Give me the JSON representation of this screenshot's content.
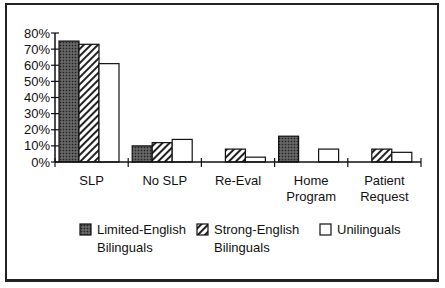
{
  "chart_data": {
    "type": "bar",
    "title": "",
    "xlabel": "",
    "ylabel": "",
    "ylim": [
      0,
      80
    ],
    "yticks": [
      "0%",
      "10%",
      "20%",
      "30%",
      "40%",
      "50%",
      "60%",
      "70%",
      "80%"
    ],
    "categories": [
      "SLP",
      "No SLP",
      "Re-Eval",
      "Home Program",
      "Patient Request"
    ],
    "category_lines": [
      [
        "SLP"
      ],
      [
        "No SLP"
      ],
      [
        "Re-Eval"
      ],
      [
        "Home",
        "Program"
      ],
      [
        "Patient",
        "Request"
      ]
    ],
    "series": [
      {
        "name": "Limited-English Bilinguals",
        "pattern": "dark-dotted",
        "values": [
          75,
          10,
          0,
          16,
          0
        ]
      },
      {
        "name": "Strong-English Bilinguals",
        "pattern": "diagonal-hatch",
        "values": [
          73,
          12,
          8,
          0,
          8
        ]
      },
      {
        "name": "Unilinguals",
        "pattern": "white",
        "values": [
          61,
          14,
          3,
          8,
          6
        ]
      }
    ],
    "legend_position": "bottom",
    "grid": false
  },
  "legend": {
    "items": [
      {
        "line1": "Limited-English",
        "line2": "Bilinguals"
      },
      {
        "line1": "Strong-English",
        "line2": "Bilinguals"
      },
      {
        "line1": "Unilinguals",
        "line2": ""
      }
    ]
  }
}
